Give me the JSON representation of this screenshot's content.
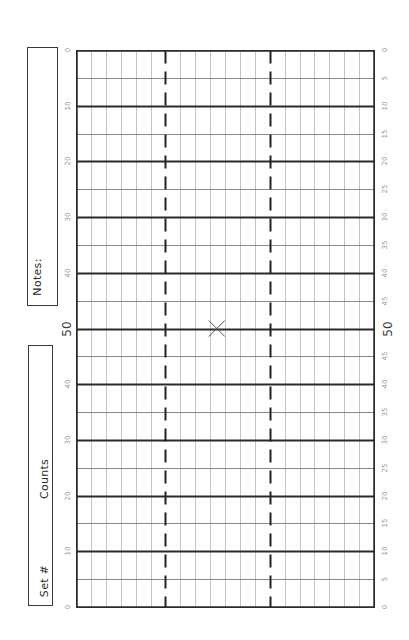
{
  "form": {
    "notes_label": "Notes:",
    "set_label": "Set #",
    "counts_label": "Counts"
  },
  "grid": {
    "columns": 20,
    "rows": 20,
    "dashed_columns": [
      6,
      13
    ],
    "thick_every_rows": 2,
    "mark": {
      "symbol": "X",
      "column": 9.45,
      "row": 10
    }
  },
  "left_scale": [
    "0",
    "10",
    "20",
    "30",
    "40",
    "50",
    "40",
    "30",
    "20",
    "10",
    "0"
  ],
  "right_scale": [
    "0",
    "5",
    "10",
    "15",
    "20",
    "25",
    "30",
    "35",
    "40",
    "45",
    "50",
    "45",
    "40",
    "35",
    "30",
    "25",
    "20",
    "15",
    "10",
    "5",
    "0"
  ],
  "major_label": "50",
  "colors": {
    "border": "#2a2a2a",
    "thick_line": "#2a2a2a",
    "thin_row_line": "#8a8a8a",
    "thin_col_line": "#c4c4c4",
    "dashed_line": "#222222",
    "mark": "#555555"
  }
}
